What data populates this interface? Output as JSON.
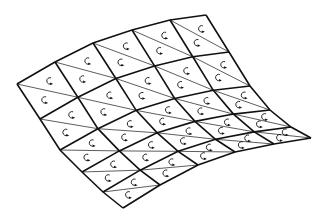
{
  "diagram": {
    "type": "curved-triangulated-mesh",
    "grid": {
      "rows": 5,
      "cols": 5
    },
    "colors": {
      "edge": "#111111",
      "diagonal": "#333333",
      "arrow": "#111111",
      "background": "#ffffff"
    },
    "boundary": {
      "top": [
        [
          17,
          84
        ],
        [
          55,
          62
        ],
        [
          93,
          43
        ],
        [
          132,
          30
        ],
        [
          170,
          20
        ],
        [
          206,
          15
        ]
      ],
      "bottom": [
        [
          123,
          208
        ],
        [
          160,
          185
        ],
        [
          198,
          165
        ],
        [
          235,
          152
        ],
        [
          274,
          144
        ],
        [
          311,
          138
        ]
      ],
      "left": [
        [
          17,
          84
        ],
        [
          40,
          119
        ],
        [
          60,
          150
        ],
        [
          82,
          172
        ],
        [
          103,
          192
        ],
        [
          123,
          208
        ]
      ],
      "right": [
        [
          206,
          15
        ],
        [
          229,
          52
        ],
        [
          250,
          86
        ],
        [
          270,
          110
        ],
        [
          291,
          127
        ],
        [
          311,
          138
        ]
      ]
    },
    "cell_icon": "curved-arrow-icon",
    "triangles_per_cell": 2
  }
}
